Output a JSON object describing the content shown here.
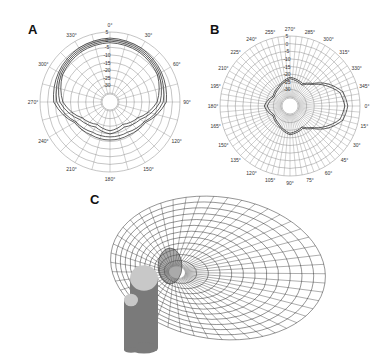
{
  "chart_data": [
    {
      "panel": "A",
      "type": "polar-line",
      "angle_unit": "degrees",
      "angle_ticks": [
        "0°",
        "30°",
        "60°",
        "90°",
        "120°",
        "150°",
        "180°",
        "210°",
        "240°",
        "270°",
        "300°",
        "330°"
      ],
      "radial_ticks": [
        "5",
        "0",
        "-5",
        "-10",
        "-15",
        "-20",
        "-25",
        "-30"
      ],
      "radial_range": [
        -35,
        5
      ],
      "grid": true,
      "center": [
        110,
        102
      ],
      "radius": 70,
      "series": [
        {
          "name": "trace-1",
          "angles": [
            0,
            30,
            60,
            90,
            120,
            150,
            180,
            210,
            240,
            270,
            300,
            330
          ],
          "values": [
            1,
            0,
            -2,
            -4,
            -14,
            -16,
            -16,
            -16,
            -14,
            -4,
            -2,
            0
          ]
        },
        {
          "name": "trace-2",
          "angles": [
            0,
            30,
            60,
            90,
            120,
            150,
            180,
            210,
            240,
            270,
            300,
            330
          ],
          "values": [
            0,
            -1,
            -3,
            -6,
            -15,
            -18,
            -18,
            -18,
            -15,
            -6,
            -3,
            -1
          ]
        },
        {
          "name": "trace-3",
          "angles": [
            0,
            30,
            60,
            90,
            120,
            150,
            180,
            210,
            240,
            270,
            300,
            330
          ],
          "values": [
            -1,
            -2,
            -4,
            -8,
            -18,
            -22,
            -20,
            -22,
            -18,
            -8,
            -4,
            -2
          ]
        },
        {
          "name": "trace-4",
          "angles": [
            0,
            30,
            60,
            90,
            120,
            150,
            180,
            210,
            240,
            270,
            300,
            330
          ],
          "values": [
            -2,
            -3,
            -5,
            -10,
            -20,
            -24,
            -22,
            -24,
            -20,
            -10,
            -5,
            -3
          ]
        }
      ]
    },
    {
      "panel": "B",
      "type": "polar-line",
      "angle_unit": "degrees",
      "angle_ticks": [
        "255°",
        "270°",
        "285°",
        "300°",
        "315°",
        "330°",
        "345°",
        "0°",
        "15°",
        "30°",
        "45°",
        "60°",
        "75°",
        "90°",
        "105°",
        "120°",
        "135°",
        "150°",
        "165°",
        "180°",
        "195°",
        "210°",
        "225°",
        "240°"
      ],
      "radial_ticks": [
        "5",
        "0",
        "-5",
        "-10",
        "-15",
        "-20",
        "-25",
        "-30"
      ],
      "radial_range": [
        -35,
        5
      ],
      "grid": true,
      "center": [
        290,
        106
      ],
      "radius": 70,
      "series": [
        {
          "name": "main-lobe-1",
          "angles": [
            0,
            15,
            30,
            45,
            60,
            90,
            120,
            150,
            180,
            210,
            240,
            270,
            300,
            315,
            330,
            345
          ],
          "values": [
            -3,
            -5,
            -12,
            -20,
            -24,
            -22,
            -26,
            -28,
            -24,
            -28,
            -26,
            -22,
            -24,
            -20,
            -12,
            -5
          ]
        },
        {
          "name": "main-lobe-2",
          "angles": [
            0,
            15,
            30,
            45,
            60,
            90,
            120,
            150,
            180,
            210,
            240,
            270,
            300,
            315,
            330,
            345
          ],
          "values": [
            -5,
            -7,
            -14,
            -21,
            -25,
            -23,
            -27,
            -29,
            -26,
            -29,
            -27,
            -23,
            -25,
            -21,
            -14,
            -7
          ]
        }
      ]
    },
    {
      "panel": "C",
      "type": "3d-surface",
      "description": "3D wireframe directivity balloon (torus-like lobe) with two cylinders"
    }
  ],
  "panels": {
    "a_label": "A",
    "b_label": "B",
    "c_label": "C"
  },
  "colors": {
    "grid": "#8a8a8a",
    "trace": "#333333",
    "cylinder_body": "#7a7a7a",
    "cylinder_top": "#c8c8c8",
    "wire": "#222222"
  }
}
